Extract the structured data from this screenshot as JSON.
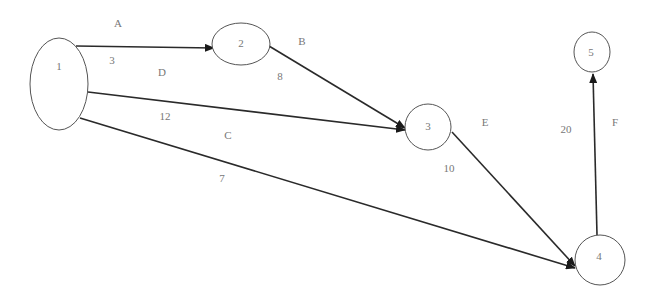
{
  "diagram": {
    "type": "network-graph",
    "nodes": [
      {
        "id": "1",
        "label": "1",
        "cx": 59,
        "cy": 84,
        "rx": 29,
        "ry": 46,
        "label_x": 59,
        "label_y": 66
      },
      {
        "id": "2",
        "label": "2",
        "cx": 241,
        "cy": 44,
        "rx": 29,
        "ry": 21,
        "label_x": 241,
        "label_y": 43
      },
      {
        "id": "3",
        "label": "3",
        "cx": 428,
        "cy": 127,
        "rx": 23,
        "ry": 23,
        "label_x": 428,
        "label_y": 126
      },
      {
        "id": "4",
        "label": "4",
        "cx": 600,
        "cy": 260,
        "rx": 25,
        "ry": 25,
        "label_x": 599,
        "label_y": 256
      },
      {
        "id": "5",
        "label": "5",
        "cx": 592,
        "cy": 52,
        "rx": 18,
        "ry": 20,
        "label_x": 591,
        "label_y": 52
      }
    ],
    "edges": [
      {
        "id": "A",
        "from": "1",
        "to": "2",
        "name": "A",
        "weight": "3",
        "x1": 76,
        "y1": 46,
        "x2": 214,
        "y2": 48,
        "name_pos": [
          118,
          27
        ],
        "weight_pos": [
          112,
          64
        ]
      },
      {
        "id": "B",
        "from": "2",
        "to": "3",
        "name": "B",
        "weight": "8",
        "x1": 269,
        "y1": 46,
        "x2": 405,
        "y2": 128,
        "name_pos": [
          302,
          45
        ],
        "weight_pos": [
          280,
          80
        ]
      },
      {
        "id": "D",
        "from": "1",
        "to": "3",
        "name": "D",
        "weight": "12",
        "x1": 88,
        "y1": 92,
        "x2": 405,
        "y2": 130,
        "name_pos": [
          162,
          76
        ],
        "weight_pos": [
          165,
          120
        ]
      },
      {
        "id": "C",
        "from": "1",
        "to": "4",
        "name": "C",
        "weight": "7",
        "x1": 80,
        "y1": 118,
        "x2": 575,
        "y2": 268,
        "name_pos": [
          228,
          139
        ],
        "weight_pos": [
          222,
          182
        ]
      },
      {
        "id": "E",
        "from": "3",
        "to": "4",
        "name": "E",
        "weight": "10",
        "x1": 452,
        "y1": 132,
        "x2": 575,
        "y2": 266,
        "name_pos": [
          485,
          126
        ],
        "weight_pos": [
          449,
          172
        ]
      },
      {
        "id": "F",
        "from": "4",
        "to": "5",
        "name": "F",
        "weight": "20",
        "x1": 597,
        "y1": 235,
        "x2": 593,
        "y2": 74,
        "name_pos": [
          615,
          126
        ],
        "weight_pos": [
          566,
          133
        ]
      }
    ],
    "colors": {
      "edge": "#2a2a2a",
      "node_stroke": "#555555",
      "text": "#777777",
      "background": "#ffffff"
    }
  }
}
